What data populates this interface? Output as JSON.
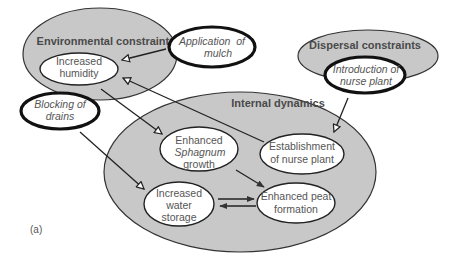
{
  "colors": {
    "group_fill": "#c8c8c8",
    "group_stroke": "#333333",
    "node_fill": "#ffffff",
    "node_stroke": "#222222",
    "text": "#555555",
    "title_text": "#4a4a4a"
  },
  "groups": {
    "environmental": {
      "title": "Environmental constraints"
    },
    "dispersal": {
      "title": "Dispersal constraints"
    },
    "internal": {
      "title": "Internal dynamics"
    }
  },
  "nodes": {
    "increased_humidity": {
      "line1": "Increased",
      "line2": "humidity"
    },
    "application_mulch": {
      "line1": "Application  of",
      "line2": "mulch",
      "type": "intervention"
    },
    "blocking_drains": {
      "line1": "Blocking of",
      "line2": "drains",
      "type": "intervention"
    },
    "introduction_nurse": {
      "line1": "Introduction of",
      "line2": "nurse plant",
      "type": "intervention"
    },
    "sphagnum_growth": {
      "line1": "Enhanced",
      "line2": "Sphagnum",
      "line3": "growth"
    },
    "establishment_nurse": {
      "line1": "Establishment",
      "line2": "of nurse plant"
    },
    "water_storage": {
      "line1": "Increased",
      "line2": "water",
      "line3": "storage"
    },
    "peat_formation": {
      "line1": "Enhanced peat",
      "line2": "formation"
    }
  },
  "edges": [
    {
      "from": "Application of mulch",
      "to": "Increased humidity",
      "arrow": "open"
    },
    {
      "from": "Establishment of nurse plant",
      "to": "Increased humidity",
      "arrow": "open"
    },
    {
      "from": "Increased humidity",
      "to": "Enhanced Sphagnum growth",
      "arrow": "open"
    },
    {
      "from": "Blocking of drains",
      "to": "Increased water storage",
      "arrow": "open"
    },
    {
      "from": "Introduction of nurse plant",
      "to": "Establishment of nurse plant",
      "arrow": "open"
    },
    {
      "from": "Enhanced Sphagnum growth",
      "to": "Enhanced peat formation",
      "arrow": "filled"
    },
    {
      "from": "Increased water storage",
      "to": "Enhanced peat formation",
      "arrow": "filled"
    },
    {
      "from": "Enhanced peat formation",
      "to": "Increased water storage",
      "arrow": "filled"
    }
  ],
  "panel_label": "(a)"
}
